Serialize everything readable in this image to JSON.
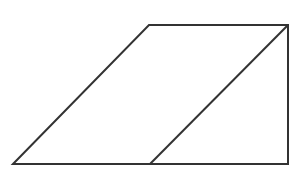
{
  "diagram": {
    "stroke_color": "#333333",
    "background": "#ffffff",
    "shapes": {
      "outline": {
        "points": [
          [
            13,
            164
          ],
          [
            149,
            25
          ],
          [
            288,
            25
          ],
          [
            288,
            164
          ]
        ]
      },
      "divider": {
        "from": [
          150,
          164
        ],
        "to": [
          288,
          25
        ]
      }
    },
    "labels": []
  }
}
